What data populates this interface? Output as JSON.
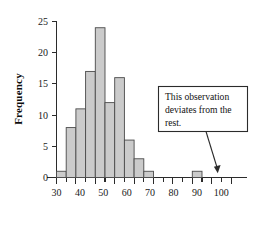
{
  "chart_data": {
    "type": "bar",
    "title": "",
    "subtitle": "",
    "xlabel": "",
    "ylabel": "Frequency",
    "grid": false,
    "legend": "none",
    "bin_width": 5,
    "xlim": [
      27,
      107
    ],
    "ylim": [
      0,
      25
    ],
    "x_major_ticks": [
      30,
      40,
      50,
      60,
      70,
      80,
      90,
      100
    ],
    "x_minor_ticks": [
      35,
      45,
      55,
      65,
      75,
      85,
      95,
      105
    ],
    "x_tick_labels": [
      "30",
      "40",
      "50",
      "60",
      "70",
      "80",
      "90",
      "100"
    ],
    "y_ticks": [
      0,
      5,
      10,
      15,
      20,
      25
    ],
    "y_tick_labels": [
      "0",
      "5",
      "10",
      "15",
      "20",
      "25"
    ],
    "bins": [
      {
        "start": 30,
        "end": 35,
        "value": 1
      },
      {
        "start": 35,
        "end": 40,
        "value": 8
      },
      {
        "start": 40,
        "end": 45,
        "value": 11
      },
      {
        "start": 45,
        "end": 50,
        "value": 17
      },
      {
        "start": 50,
        "end": 55,
        "value": 24
      },
      {
        "start": 55,
        "end": 60,
        "value": 12
      },
      {
        "start": 60,
        "end": 65,
        "value": 16
      },
      {
        "start": 65,
        "end": 70,
        "value": 6
      },
      {
        "start": 70,
        "end": 75,
        "value": 3
      },
      {
        "start": 75,
        "end": 80,
        "value": 1
      },
      {
        "start": 100,
        "end": 105,
        "value": 1
      }
    ],
    "categories": [
      "30-35",
      "35-40",
      "40-45",
      "45-50",
      "50-55",
      "55-60",
      "60-65",
      "65-70",
      "70-75",
      "75-80",
      "100-105"
    ],
    "values": [
      1,
      8,
      11,
      17,
      24,
      12,
      16,
      6,
      3,
      1,
      1
    ],
    "annotations": [
      {
        "id": "outlier-callout",
        "text": "This observation deviates from the rest.",
        "lines": [
          "This observation",
          "deviates from the",
          "rest."
        ],
        "points_to_bin": "100-105"
      }
    ],
    "colors": {
      "bar_fill": "#cbcbcb",
      "bar_stroke": "#4a4a4a",
      "axis": "#2b2b2b",
      "text": "#121212",
      "background": "#ffffff"
    }
  }
}
